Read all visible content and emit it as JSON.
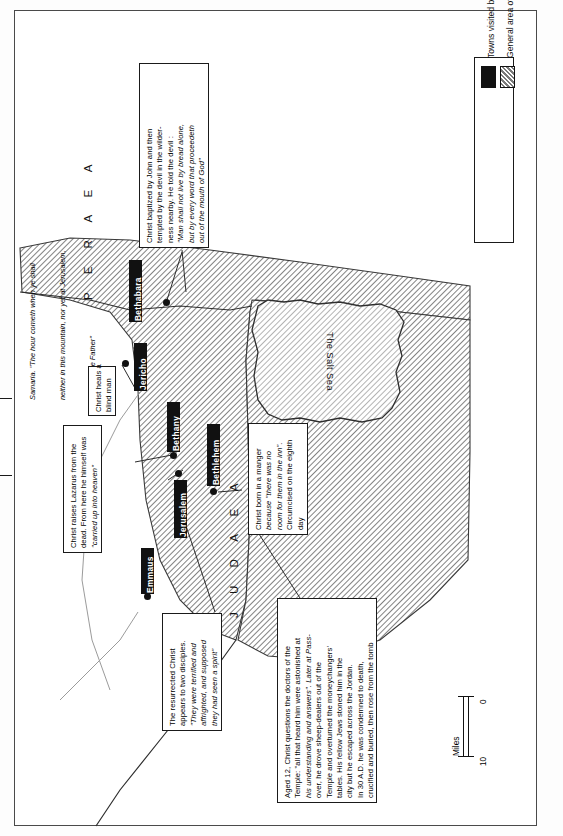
{
  "map": {
    "title_regions": [
      {
        "name": "peraea",
        "label": "P E R A E A"
      },
      {
        "name": "judaea",
        "label": "J U D A E A"
      }
    ],
    "water_label": "The Salt Sea",
    "edge_note": "Samaria. \"The hour cometh when ye shall neither in this mountain, nor yet at Jerusalem, worship the Father\"",
    "towns": [
      {
        "name": "bethabara",
        "label": "Bethabara"
      },
      {
        "name": "jericho",
        "label": "Jericho"
      },
      {
        "name": "bethany",
        "label": "Bethany"
      },
      {
        "name": "jerusalem",
        "label": "Jerusalem"
      },
      {
        "name": "bethlehem",
        "label": "Bethlehem"
      },
      {
        "name": "emmaus",
        "label": "Emmaus"
      }
    ],
    "callouts": [
      {
        "name": "baptism-temptation",
        "lines": [
          {
            "text": "Christ baptized by John and then",
            "italic": false
          },
          {
            "text": "tempted by the devil in the wilder-",
            "italic": false
          },
          {
            "text": "ness nearby. He told the devil :",
            "italic": false
          },
          {
            "text": "\"Man shall not live by bread alone,",
            "italic": true
          },
          {
            "text": "but by every word that proceedeth",
            "italic": true
          },
          {
            "text": "out of the mouth of God\"",
            "italic": true
          }
        ]
      },
      {
        "name": "blind-man",
        "lines": [
          {
            "text": "Christ heals a",
            "italic": false
          },
          {
            "text": "blind man",
            "italic": false
          }
        ]
      },
      {
        "name": "lazarus-ascension",
        "lines": [
          {
            "text": "Christ raises Lazarus from the",
            "italic": false
          },
          {
            "text": "dead. From here he himself was",
            "italic": false
          },
          {
            "text": "\"carried up into heaven\"",
            "italic": true
          }
        ]
      },
      {
        "name": "nativity",
        "lines": [
          {
            "text": "Christ born in a manger",
            "italic": false
          },
          {
            "text": "because \"there was no",
            "italic": true
          },
          {
            "text": "room for them in the inn\".",
            "italic": true
          },
          {
            "text": "Circumcised on the eighth",
            "italic": false
          },
          {
            "text": "day",
            "italic": false
          }
        ]
      },
      {
        "name": "resurrection-appearance",
        "lines": [
          {
            "text": "The resurrected Christ",
            "italic": false
          },
          {
            "text": "appears to two disciples.",
            "italic": false
          },
          {
            "text": "\"They were terrified and",
            "italic": true
          },
          {
            "text": "affrighted, and supposed",
            "italic": true
          },
          {
            "text": "they had seen a spirit\"",
            "italic": true
          }
        ]
      },
      {
        "name": "temple-passover-crucifixion",
        "lines": [
          {
            "text": "Aged 12, Christ questions the doctors of the",
            "italic": false
          },
          {
            "text": "Temple: \"all that heard him were astonished at",
            "italic": false
          },
          {
            "text": "his understanding and answers\". Later at Pass-",
            "italic": true
          },
          {
            "text": "over, he drove sheep-dealers out of the",
            "italic": false
          },
          {
            "text": "Temple and overturned the moneychangers'",
            "italic": false
          },
          {
            "text": "tables. His fellow Jews stoned him in the",
            "italic": false
          },
          {
            "text": "city but he escaped across the Jordan.",
            "italic": false
          },
          {
            "text": "In 30 A.D. he was condemned to death,",
            "italic": false
          },
          {
            "text": "crucified and buried, then rose from the tomb",
            "italic": false
          }
        ]
      }
    ]
  },
  "legend": {
    "items": [
      {
        "name": "towns-visited",
        "label": "Towns visited by Christ",
        "swatch": "solid",
        "color": "#111111"
      },
      {
        "name": "ministry-area",
        "label": "General area of Christ's Ministries",
        "swatch": "hatch",
        "color": "#111111"
      }
    ]
  },
  "scale": {
    "min": "0",
    "max": "10",
    "unit": "Miles"
  }
}
